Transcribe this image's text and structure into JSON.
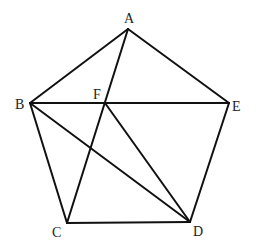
{
  "diagram": {
    "type": "geometry",
    "stroke_color": "#111111",
    "label_color": "#222222",
    "points": {
      "A": {
        "x": 128,
        "y": 29,
        "label": "A",
        "label_x": 124,
        "label_y": 23
      },
      "B": {
        "x": 30,
        "y": 103,
        "label": "B",
        "label_x": 15,
        "label_y": 109
      },
      "C": {
        "x": 67,
        "y": 223,
        "label": "C",
        "label_x": 52,
        "label_y": 237
      },
      "D": {
        "x": 190,
        "y": 222,
        "label": "D",
        "label_x": 193,
        "label_y": 236
      },
      "E": {
        "x": 229,
        "y": 103,
        "label": "E",
        "label_x": 232,
        "label_y": 111
      },
      "F": {
        "x": 105,
        "y": 103,
        "label": "F",
        "label_x": 93,
        "label_y": 99
      }
    },
    "edges": [
      {
        "from": "A",
        "to": "B"
      },
      {
        "from": "A",
        "to": "E"
      },
      {
        "from": "B",
        "to": "E"
      },
      {
        "from": "B",
        "to": "C"
      },
      {
        "from": "C",
        "to": "D"
      },
      {
        "from": "D",
        "to": "E"
      },
      {
        "from": "A",
        "to": "C"
      },
      {
        "from": "B",
        "to": "D"
      },
      {
        "from": "F",
        "to": "D"
      }
    ]
  }
}
